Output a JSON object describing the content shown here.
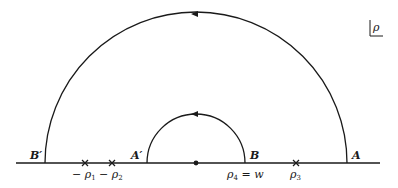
{
  "diagram": {
    "type": "contour-integration-path",
    "plane_label": "ρ",
    "points": {
      "A": "A",
      "A_prime": "A′",
      "B": "B",
      "B_prime": "B′"
    },
    "poles": [
      {
        "label": "−ρ₁",
        "sub": "1",
        "x": 85
      },
      {
        "label": "−ρ₂",
        "sub": "2",
        "x": 112
      },
      {
        "label": "ρ₃",
        "sub": "3",
        "x": 296
      }
    ],
    "pole_labels": {
      "neg_rho1": "− ρ",
      "neg_rho1_sub": "1",
      "neg_rho2": "− ρ",
      "neg_rho2_sub": "2",
      "rho3": "ρ",
      "rho3_sub": "3",
      "rho4": "ρ",
      "rho4_sub": "4",
      "rho4_eq": " = w"
    },
    "origin_dot": true,
    "outer_arc": {
      "direction": "counterclockwise",
      "from": "A",
      "to": "B′"
    },
    "inner_arc": {
      "direction": "clockwise",
      "from": "A′",
      "to": "B"
    }
  }
}
